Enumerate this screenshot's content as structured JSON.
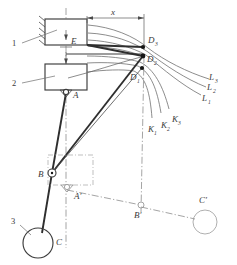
{
  "figure": {
    "type": "kinematic-linkage-diagram",
    "title": "",
    "background_color": "#ffffff",
    "line_color": "#3c3c3c",
    "curve_color": "#676767",
    "centerline_color": "#8d8d8d",
    "label_color": "#3a3a3a"
  },
  "part_labels": [
    {
      "id": "part-1",
      "text": "1"
    },
    {
      "id": "part-2",
      "text": "2"
    },
    {
      "id": "part-3",
      "text": "3"
    }
  ],
  "dimensions": [
    {
      "id": "horizontal-x",
      "text": "x",
      "orientation": "horizontal"
    },
    {
      "id": "vertical-e",
      "text": "E",
      "orientation": "vertical"
    }
  ],
  "point_labels": [
    {
      "id": "point-d3",
      "base": "D",
      "sub": "3"
    },
    {
      "id": "point-d2",
      "base": "D",
      "sub": "2"
    },
    {
      "id": "point-d1",
      "base": "D",
      "sub": "1"
    },
    {
      "id": "point-a",
      "base": "A",
      "sub": ""
    },
    {
      "id": "point-b",
      "base": "B",
      "sub": ""
    },
    {
      "id": "point-c",
      "base": "C",
      "sub": ""
    },
    {
      "id": "point-a-prime",
      "base": "A′",
      "sub": ""
    },
    {
      "id": "point-b-prime",
      "base": "B′",
      "sub": ""
    },
    {
      "id": "point-c-prime",
      "base": "C′",
      "sub": ""
    }
  ],
  "curve_labels": {
    "l_family": [
      {
        "id": "curve-l3",
        "base": "L",
        "sub": "3"
      },
      {
        "id": "curve-l2",
        "base": "L",
        "sub": "2"
      },
      {
        "id": "curve-l1",
        "base": "L",
        "sub": "1"
      }
    ],
    "k_family": [
      {
        "id": "curve-k1",
        "base": "K",
        "sub": "1"
      },
      {
        "id": "curve-k2",
        "base": "K",
        "sub": "2"
      },
      {
        "id": "curve-k3",
        "base": "K",
        "sub": "3"
      }
    ]
  },
  "components": {
    "block_1": {
      "name": "fixed-guide-block",
      "hatched": true
    },
    "block_2": {
      "name": "slider-block",
      "hatched": false
    },
    "roller_3": {
      "name": "roller-circle"
    },
    "roller_c_prime": {
      "name": "roller-circle-displaced"
    },
    "ghost_box": {
      "name": "displaced-slider-outline"
    }
  }
}
